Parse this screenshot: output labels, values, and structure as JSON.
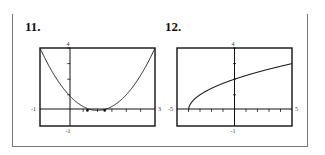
{
  "problems": [
    {
      "label": "11."
    },
    {
      "label": "12."
    }
  ],
  "chart_data": [
    {
      "type": "line",
      "title": "11.",
      "xlim": [
        -1,
        3
      ],
      "ylim": [
        -1,
        4
      ],
      "x_tick_labels": [
        "-1",
        "3"
      ],
      "y_tick_labels": [
        "4",
        "-1"
      ],
      "x_ticks": [
        0.5,
        1,
        1.5,
        2,
        2.5
      ],
      "y_ticks": [
        1,
        2,
        3,
        4
      ],
      "grid": false,
      "series": [
        {
          "name": "f(x) = (x-1)^2",
          "x": [
            -1,
            -0.75,
            -0.5,
            -0.25,
            0,
            0.25,
            0.5,
            0.75,
            1,
            1.25,
            1.5,
            1.75,
            2,
            2.25,
            2.5,
            2.75,
            3
          ],
          "y": [
            4,
            3.06,
            2.25,
            1.56,
            1,
            0.56,
            0.25,
            0.06,
            0,
            0.06,
            0.25,
            0.56,
            1,
            1.56,
            2.25,
            3.06,
            4
          ]
        }
      ],
      "marked_points": [
        [
          0.65,
          0
        ],
        [
          1.25,
          0
        ]
      ]
    },
    {
      "type": "line",
      "title": "12.",
      "xlim": [
        -5,
        5
      ],
      "ylim": [
        -1,
        4
      ],
      "x_tick_labels": [
        "-5",
        "5"
      ],
      "y_tick_labels": [
        "4",
        "-1"
      ],
      "x_ticks": [
        -4,
        -3,
        -2,
        -1,
        1,
        2,
        3,
        4
      ],
      "y_ticks": [
        1,
        2,
        3,
        4
      ],
      "grid": false,
      "series": [
        {
          "name": "f(x) = sqrt(x+4)",
          "x": [
            -4,
            -3.75,
            -3.5,
            -3,
            -2,
            -1,
            0,
            1,
            2,
            3,
            4,
            5
          ],
          "y": [
            0,
            0.5,
            0.71,
            1,
            1.41,
            1.73,
            2,
            2.24,
            2.45,
            2.65,
            2.83,
            3
          ]
        }
      ]
    }
  ]
}
